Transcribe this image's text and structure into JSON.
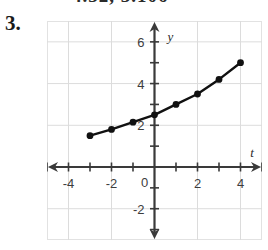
{
  "clipped_header": {
    "text": "4.32, 3.106"
  },
  "problem": {
    "number_label": "3."
  },
  "colors": {
    "curve": "#111111",
    "point": "#111111",
    "axis": "#3a3a3a",
    "grid": "#dcdcdc",
    "frame": "#e2e2e2",
    "tick_label": "#3d3d3d"
  },
  "chart_data": {
    "type": "scatter",
    "title": "",
    "subtitle": "",
    "xlabel": "t",
    "ylabel": "y",
    "xlim": [
      -5,
      5
    ],
    "ylim": [
      -3.5,
      7
    ],
    "grid": true,
    "grid_step": 2,
    "legend": "none",
    "x_tick_labels": [
      "-4",
      "-2",
      "0",
      "2",
      "4"
    ],
    "x_ticks": [
      -4,
      -2,
      0,
      2,
      4
    ],
    "x_minor_ticks": [
      -5,
      -3,
      -1,
      1,
      3,
      5
    ],
    "y_tick_labels": [
      "6",
      "4",
      "2",
      "0",
      "-2"
    ],
    "y_ticks": [
      6,
      4,
      2,
      0,
      -2
    ],
    "y_minor_ticks": [
      5,
      3,
      1,
      -1,
      -3
    ],
    "origin_label": "0",
    "connected": true,
    "marker": "filled-circle",
    "series": [
      {
        "name": "curve",
        "x": [
          -3,
          -2,
          -1,
          0,
          1,
          2,
          3,
          4
        ],
        "values": [
          1.5,
          1.8,
          2.15,
          2.5,
          3.0,
          3.5,
          4.2,
          5.0
        ]
      }
    ]
  }
}
